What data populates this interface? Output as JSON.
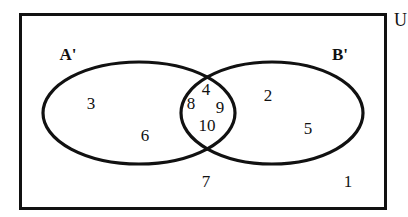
{
  "figure": {
    "type": "venn-diagram",
    "universe_label": "U",
    "set_labels": {
      "left": "A'",
      "right": "B'"
    },
    "colors": {
      "stroke": "#111111",
      "background": "#ffffff"
    },
    "regions": [
      {
        "name": "left-only",
        "description": "inside A' only",
        "elements": [
          "3",
          "6"
        ]
      },
      {
        "name": "intersection",
        "description": "inside A' and B'",
        "elements": [
          "4",
          "8",
          "9",
          "10"
        ]
      },
      {
        "name": "right-only",
        "description": "inside B' only",
        "elements": [
          "2",
          "5"
        ]
      },
      {
        "name": "outside",
        "description": "inside U but outside A' and B'",
        "elements": [
          "7",
          "1"
        ]
      }
    ]
  },
  "elements": {
    "left_3": "3",
    "left_6": "6",
    "mid_4": "4",
    "mid_8": "8",
    "mid_9": "9",
    "mid_10": "10",
    "right_2": "2",
    "right_5": "5",
    "outside_7": "7",
    "outside_1": "1"
  }
}
